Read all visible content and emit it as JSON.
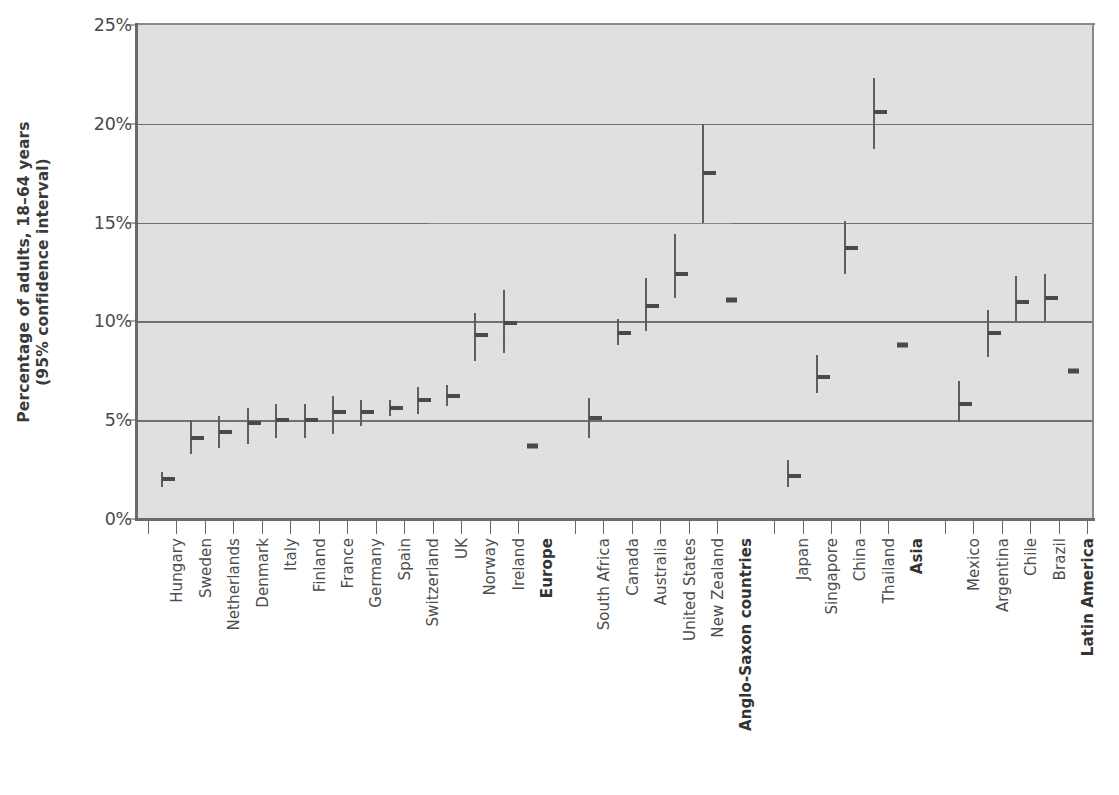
{
  "chart_data": {
    "type": "scatter",
    "title": "",
    "subtitle": "",
    "xlabel": "",
    "ylabel": "Percentage of adults, 18–64 years\n(95% confidence interval)",
    "ylabel_line1": "Percentage of adults, 18–64 years",
    "ylabel_line2": "(95% confidence interval)",
    "ylim": [
      0,
      25
    ],
    "yticks": [
      0,
      5,
      10,
      15,
      20,
      25
    ],
    "ytick_labels": [
      "0%",
      "5%",
      "10%",
      "15%",
      "20%",
      "25%"
    ],
    "grid": true,
    "grid_axis": "y",
    "legend": "none",
    "error_bars": "95% confidence interval",
    "categories": [
      "Hungary",
      "Sweden",
      "Netherlands",
      "Denmark",
      "Italy",
      "Finland",
      "France",
      "Germany",
      "Spain",
      "Switzerland",
      "UK",
      "Norway",
      "Ireland",
      "Europe",
      "South Africa",
      "Canada",
      "Australia",
      "United States",
      "New Zealand",
      "Anglo-Saxon countries",
      "Japan",
      "Singapore",
      "China",
      "Thailand",
      "Asia",
      "Mexico",
      "Argentina",
      "Chile",
      "Brazil",
      "Latin America"
    ],
    "bold_categories": [
      "Europe",
      "Anglo-Saxon countries",
      "Asia",
      "Latin America"
    ],
    "points": [
      {
        "label": "Hungary",
        "value": 2.0,
        "ci_low": 1.6,
        "ci_high": 2.4,
        "aggregate": false,
        "gap_before": false
      },
      {
        "label": "Sweden",
        "value": 4.1,
        "ci_low": 3.3,
        "ci_high": 5.0,
        "aggregate": false,
        "gap_before": false
      },
      {
        "label": "Netherlands",
        "value": 4.4,
        "ci_low": 3.6,
        "ci_high": 5.2,
        "aggregate": false,
        "gap_before": false
      },
      {
        "label": "Denmark",
        "value": 4.85,
        "ci_low": 3.8,
        "ci_high": 5.6,
        "aggregate": false,
        "gap_before": false
      },
      {
        "label": "Italy",
        "value": 5.0,
        "ci_low": 4.1,
        "ci_high": 5.8,
        "aggregate": false,
        "gap_before": false
      },
      {
        "label": "Finland",
        "value": 5.0,
        "ci_low": 4.1,
        "ci_high": 5.8,
        "aggregate": false,
        "gap_before": false
      },
      {
        "label": "France",
        "value": 5.4,
        "ci_low": 4.3,
        "ci_high": 6.2,
        "aggregate": false,
        "gap_before": false
      },
      {
        "label": "Germany",
        "value": 5.4,
        "ci_low": 4.7,
        "ci_high": 6.0,
        "aggregate": false,
        "gap_before": false
      },
      {
        "label": "Spain",
        "value": 5.6,
        "ci_low": 5.2,
        "ci_high": 6.0,
        "aggregate": false,
        "gap_before": false
      },
      {
        "label": "Switzerland",
        "value": 6.0,
        "ci_low": 5.3,
        "ci_high": 6.7,
        "aggregate": false,
        "gap_before": false
      },
      {
        "label": "UK",
        "value": 6.2,
        "ci_low": 5.7,
        "ci_high": 6.8,
        "aggregate": false,
        "gap_before": false
      },
      {
        "label": "Norway",
        "value": 9.3,
        "ci_low": 8.0,
        "ci_high": 10.4,
        "aggregate": false,
        "gap_before": false
      },
      {
        "label": "Ireland",
        "value": 9.9,
        "ci_low": 8.4,
        "ci_high": 11.6,
        "aggregate": false,
        "gap_before": false
      },
      {
        "label": "Europe",
        "value": 3.7,
        "ci_low": 3.7,
        "ci_high": 3.7,
        "aggregate": true,
        "gap_before": false
      },
      {
        "label": "South Africa",
        "value": 5.1,
        "ci_low": 4.1,
        "ci_high": 6.1,
        "aggregate": false,
        "gap_before": true
      },
      {
        "label": "Canada",
        "value": 9.4,
        "ci_low": 8.8,
        "ci_high": 10.1,
        "aggregate": false,
        "gap_before": false
      },
      {
        "label": "Australia",
        "value": 10.8,
        "ci_low": 9.5,
        "ci_high": 12.2,
        "aggregate": false,
        "gap_before": false
      },
      {
        "label": "United States",
        "value": 12.4,
        "ci_low": 11.2,
        "ci_high": 14.4,
        "aggregate": false,
        "gap_before": false
      },
      {
        "label": "New Zealand",
        "value": 17.5,
        "ci_low": 15.0,
        "ci_high": 20.0,
        "aggregate": false,
        "gap_before": false
      },
      {
        "label": "Anglo-Saxon countries",
        "value": 11.1,
        "ci_low": 11.1,
        "ci_high": 11.1,
        "aggregate": true,
        "gap_before": false
      },
      {
        "label": "Japan",
        "value": 2.2,
        "ci_low": 1.6,
        "ci_high": 3.0,
        "aggregate": false,
        "gap_before": true
      },
      {
        "label": "Singapore",
        "value": 7.2,
        "ci_low": 6.4,
        "ci_high": 8.3,
        "aggregate": false,
        "gap_before": false
      },
      {
        "label": "China",
        "value": 13.7,
        "ci_low": 12.4,
        "ci_high": 15.1,
        "aggregate": false,
        "gap_before": false
      },
      {
        "label": "Thailand",
        "value": 20.6,
        "ci_low": 18.7,
        "ci_high": 22.3,
        "aggregate": false,
        "gap_before": false
      },
      {
        "label": "Asia",
        "value": 8.8,
        "ci_low": 8.8,
        "ci_high": 8.8,
        "aggregate": true,
        "gap_before": false
      },
      {
        "label": "Mexico",
        "value": 5.8,
        "ci_low": 4.9,
        "ci_high": 7.0,
        "aggregate": false,
        "gap_before": true
      },
      {
        "label": "Argentina",
        "value": 9.4,
        "ci_low": 8.2,
        "ci_high": 10.6,
        "aggregate": false,
        "gap_before": false
      },
      {
        "label": "Chile",
        "value": 11.0,
        "ci_low": 10.0,
        "ci_high": 12.3,
        "aggregate": false,
        "gap_before": false
      },
      {
        "label": "Brazil",
        "value": 11.2,
        "ci_low": 10.0,
        "ci_high": 12.4,
        "aggregate": false,
        "gap_before": false
      },
      {
        "label": "Latin America",
        "value": 7.5,
        "ci_low": 7.5,
        "ci_high": 7.5,
        "aggregate": true,
        "gap_before": false
      }
    ],
    "colors": {
      "plot_background": "#e0e0e0",
      "gridline": "#707070",
      "marker": "#4a4a4a",
      "error_bar": "#5e5e5e",
      "axis": "#6b6b6b",
      "text": "#4d4d4d"
    }
  }
}
